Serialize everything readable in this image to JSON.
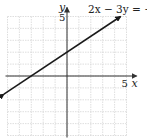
{
  "chart_data": {
    "type": "line",
    "title": "",
    "equation_label": "2x − 3y = −6",
    "xlabel": "x",
    "ylabel": "y",
    "x_tick_label": "5",
    "y_tick_label": "5",
    "xlim": [
      -5,
      5
    ],
    "ylim": [
      -5,
      5
    ],
    "grid": true,
    "grid_step": 1,
    "series": [
      {
        "name": "2x - 3y = -6",
        "slope": 0.6667,
        "intercept": 2,
        "x": [
          -5.3,
          -3,
          0,
          4.5
        ],
        "y": [
          -1.53,
          0,
          2,
          5
        ],
        "arrows": "both"
      }
    ],
    "key_points": [
      {
        "x": -3,
        "y": 0,
        "label": "x-intercept"
      },
      {
        "x": 0,
        "y": 2,
        "label": "y-intercept"
      }
    ]
  },
  "colors": {
    "grid": "#d6d6d6",
    "axis": "#333333",
    "line": "#1a1a1a",
    "background": "#ffffff"
  }
}
